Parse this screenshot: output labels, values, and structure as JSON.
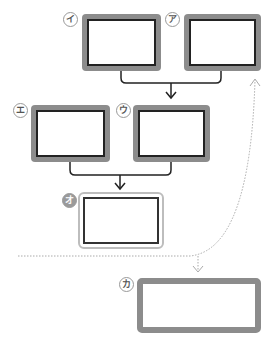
{
  "diagram": {
    "boxes": [
      {
        "id": "i",
        "label": "イ",
        "style": "thick"
      },
      {
        "id": "a",
        "label": "ア",
        "style": "thick"
      },
      {
        "id": "e",
        "label": "エ",
        "style": "thick"
      },
      {
        "id": "u",
        "label": "ウ",
        "style": "thick"
      },
      {
        "id": "o",
        "label": "オ",
        "style": "outline"
      },
      {
        "id": "ka",
        "label": "カ",
        "style": "gray"
      }
    ],
    "edges": [
      {
        "from": [
          "i",
          "a"
        ],
        "to": [
          "e",
          "u"
        ],
        "type": "merge-arrow"
      },
      {
        "from": [
          "e",
          "u"
        ],
        "to": [
          "o"
        ],
        "type": "merge-arrow"
      },
      {
        "from": "dotted-line",
        "to": "a",
        "type": "dotted-curve-arrow"
      },
      {
        "from": "dotted-line",
        "to": "ka",
        "type": "dotted-arrow"
      }
    ],
    "colors": {
      "frame": "#8c8c8c",
      "border": "#222222",
      "dotted": "#aaaaaa"
    }
  }
}
